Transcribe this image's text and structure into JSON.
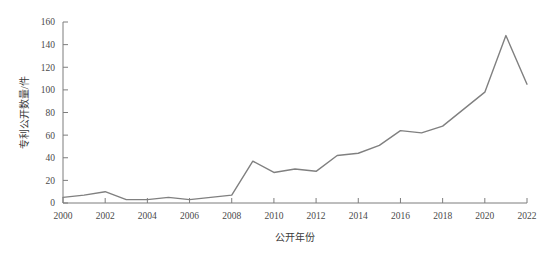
{
  "chart_data": {
    "type": "line",
    "title": "",
    "xlabel": "公开年份",
    "ylabel": "专利公开数量/件",
    "xlim": [
      2000,
      2022
    ],
    "ylim": [
      0,
      160
    ],
    "ytick_step": 20,
    "xtick_step": 2,
    "grid": false,
    "legend": "none",
    "line_color": "#808080",
    "axis_color": "#7d7d7d",
    "x": [
      2000,
      2001,
      2002,
      2003,
      2004,
      2005,
      2006,
      2007,
      2008,
      2009,
      2010,
      2011,
      2012,
      2013,
      2014,
      2015,
      2016,
      2017,
      2018,
      2019,
      2020,
      2021,
      2022
    ],
    "values": [
      5,
      7,
      10,
      3,
      3,
      5,
      3,
      5,
      7,
      37,
      27,
      30,
      28,
      42,
      44,
      51,
      64,
      62,
      68,
      83,
      98,
      148,
      105
    ],
    "ytick_labels": [
      "0",
      "20",
      "40",
      "60",
      "80",
      "100",
      "120",
      "140",
      "160"
    ],
    "ytick_values": [
      0,
      20,
      40,
      60,
      80,
      100,
      120,
      140,
      160
    ],
    "xtick_labels": [
      "2000",
      "2002",
      "2004",
      "2006",
      "2008",
      "2010",
      "2012",
      "2014",
      "2016",
      "2018",
      "2020",
      "2022"
    ],
    "xtick_values": [
      2000,
      2002,
      2004,
      2006,
      2008,
      2010,
      2012,
      2014,
      2016,
      2018,
      2020,
      2022
    ]
  }
}
